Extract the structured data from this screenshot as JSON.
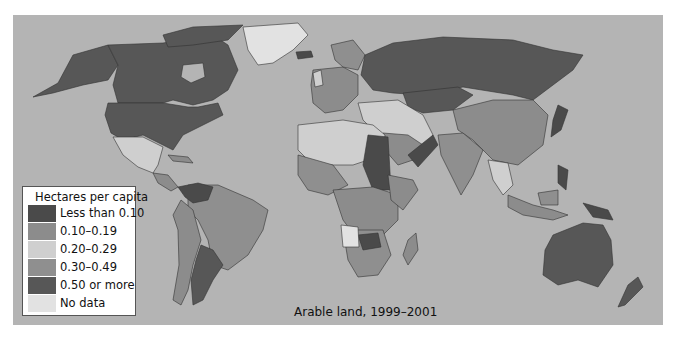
{
  "map": {
    "caption": "Arable land, 1999–2001",
    "ocean_color": "#b4b4b4",
    "legend": {
      "title": "Hectares per capita",
      "items": [
        {
          "label": "Less than 0.10",
          "color": "#4a4a4a"
        },
        {
          "label": "0.10–0.19",
          "color": "#8c8c8c"
        },
        {
          "label": "0.20–0.29",
          "color": "#cfcfcf"
        },
        {
          "label": "0.30–0.49",
          "color": "#8f8f8f"
        },
        {
          "label": "0.50 or more",
          "color": "#575757"
        },
        {
          "label": "No data",
          "color": "#e2e2e2"
        }
      ]
    }
  }
}
